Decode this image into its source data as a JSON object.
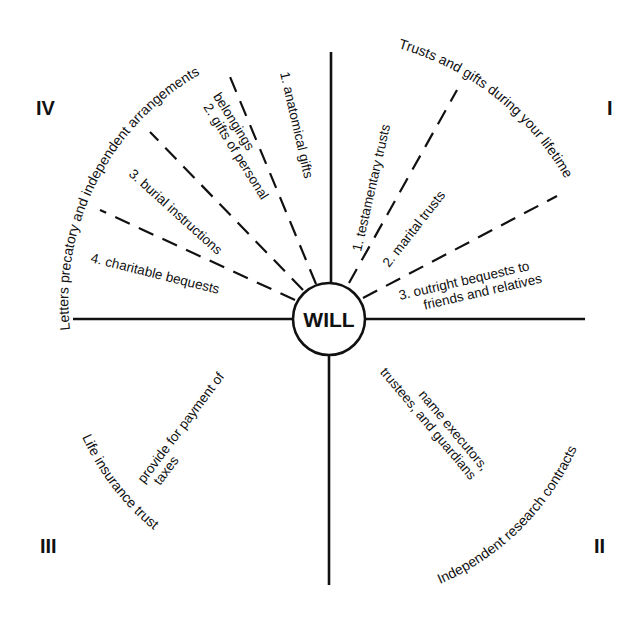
{
  "center": {
    "label": "WILL"
  },
  "quadrants": {
    "I": {
      "numeral": "I",
      "arc_label": "Trusts and gifts during your lifetime"
    },
    "II": {
      "numeral": "II",
      "arc_label": "Independent research contracts"
    },
    "III": {
      "numeral": "III",
      "arc_label": "Life insurance trust"
    },
    "IV": {
      "numeral": "IV",
      "arc_label": "Letters precatory and independent arrangements"
    }
  },
  "spokes": {
    "q1": [
      {
        "label": "1.  testamentary trusts"
      },
      {
        "label": "2.  marital trusts"
      },
      {
        "label_line1": "3.  outright bequests to",
        "label_line2": "friends and relatives"
      }
    ],
    "q2": [
      {
        "label_line1": "name executors,",
        "label_line2": "trustees, and guardians"
      }
    ],
    "q3": [
      {
        "label_line1": "provide  for  payment  of",
        "label_line2": "taxes"
      }
    ],
    "q4": [
      {
        "label": "1.  anatomical gifts"
      },
      {
        "label_line1": "2.  gifts of personal",
        "label_line2": "belongings"
      },
      {
        "label": "3.  burial instructions"
      },
      {
        "label": "4.  charitable bequests"
      }
    ]
  }
}
